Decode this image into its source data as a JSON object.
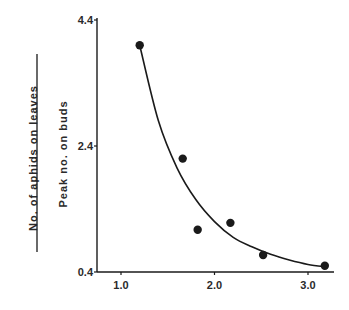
{
  "chart_data": {
    "type": "scatter",
    "title": "",
    "xlabel": "",
    "ylabel": {
      "numerator": "No. of aphids on leaves",
      "denominator": "Peak no. on buds"
    },
    "xlim": [
      0.75,
      3.25
    ],
    "ylim": [
      0.4,
      4.4
    ],
    "x_ticks": [
      1.0,
      2.0,
      3.0
    ],
    "x_tick_labels": [
      "1.0",
      "2.0",
      "3.0"
    ],
    "y_ticks": [
      0.4,
      2.4,
      4.4
    ],
    "y_tick_labels": [
      "0.4",
      "2.4",
      "4.4"
    ],
    "grid": false,
    "legend": null,
    "series": [
      {
        "name": "observed",
        "kind": "points",
        "x": [
          1.2,
          1.66,
          1.82,
          2.17,
          2.52,
          3.18
        ],
        "y": [
          4.0,
          2.2,
          1.07,
          1.18,
          0.67,
          0.5
        ]
      },
      {
        "name": "fitted curve",
        "kind": "line",
        "x": [
          1.2,
          1.4,
          1.6,
          1.8,
          2.0,
          2.2,
          2.4,
          2.6,
          2.8,
          3.0,
          3.2
        ],
        "y": [
          4.0,
          2.8,
          2.05,
          1.55,
          1.2,
          0.95,
          0.8,
          0.68,
          0.59,
          0.52,
          0.48
        ]
      }
    ]
  },
  "colors": {
    "ink": "#1a1a1a",
    "background": "#ffffff"
  }
}
